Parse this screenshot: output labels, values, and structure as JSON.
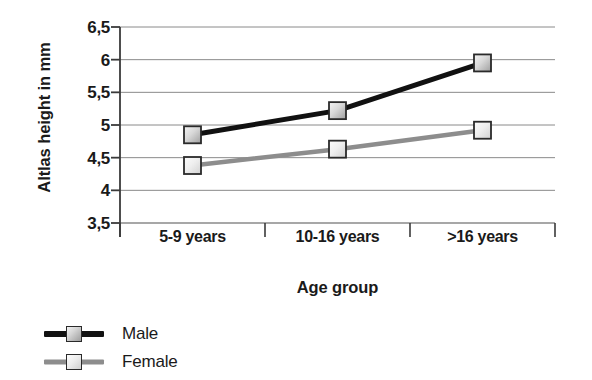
{
  "chart_data": {
    "type": "line",
    "title": "",
    "xlabel": "Age group",
    "ylabel": "Altlas height in mm",
    "categories": [
      "5-9 years",
      "10-16 years",
      ">16 years"
    ],
    "ylim": [
      3.5,
      6.5
    ],
    "ytick_labels": [
      "3,5",
      "4",
      "4,5",
      "5",
      "5,5",
      "6",
      "6,5"
    ],
    "ytick_values": [
      3.5,
      4,
      4.5,
      5,
      5.5,
      6,
      6.5
    ],
    "grid": true,
    "legend_position": "bottom-left",
    "series": [
      {
        "name": "Male",
        "values": [
          4.85,
          5.22,
          5.95
        ],
        "line_color": "#111111",
        "marker_color": "#c2c2c2"
      },
      {
        "name": "Female",
        "values": [
          4.38,
          4.63,
          4.92
        ],
        "line_color": "#8d8d8d",
        "marker_color": "#e6e6e6"
      }
    ]
  },
  "legend": {
    "items": [
      {
        "label": "Male"
      },
      {
        "label": "Female"
      }
    ]
  },
  "colors": {
    "axis": "#3a3a3a",
    "grid": "#8a8a8a",
    "background": "#ffffff"
  }
}
